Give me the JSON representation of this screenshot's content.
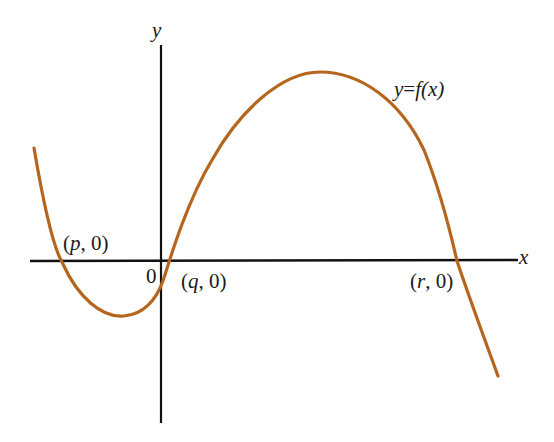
{
  "diagram": {
    "type": "function-graph",
    "axis_labels": {
      "x": "x",
      "y": "y"
    },
    "origin_label": "0",
    "curve_label": {
      "lhs": "y",
      "eq": "=",
      "fn": "f",
      "arg": "(x)",
      "full": "y = f(x)"
    },
    "points": [
      {
        "id": "p",
        "name": "p",
        "label": "(p, 0)",
        "open": "(",
        "rest": ", 0)"
      },
      {
        "id": "q",
        "name": "q",
        "label": "(q, 0)",
        "open": "(",
        "rest": ", 0)"
      },
      {
        "id": "r",
        "name": "r",
        "label": "(r, 0)",
        "open": "(",
        "rest": ", 0)"
      }
    ],
    "colors": {
      "curve": "#b5651d",
      "axes": "#111111",
      "text": "#1a1a1a",
      "background": "#ffffff"
    }
  }
}
